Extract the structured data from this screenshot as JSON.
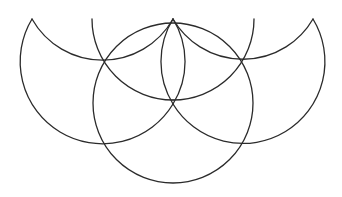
{
  "diagram": {
    "title": "",
    "background": "#ffffff",
    "stroke_color": "#2b2b2b",
    "stroke_width": 1.3,
    "shapes": [
      {
        "name": "center-circle",
        "type": "circle",
        "cx": 173,
        "cy": 103,
        "r": 80
      },
      {
        "name": "left-crescent-lower-arc",
        "type": "arc",
        "d": "M 32 19 A 81 81 0 1 0 173 104"
      },
      {
        "name": "left-crescent-upper-arc",
        "type": "arc",
        "d": "M 32 19 A 81 81 0 0 0 173 19"
      },
      {
        "name": "right-crescent-lower-arc",
        "type": "arc",
        "d": "M 313 19 A 81 81 0 1 1 173 104"
      },
      {
        "name": "right-crescent-upper-arc",
        "type": "arc",
        "d": "M 313 19 A 81 81 0 0 1 173 19"
      },
      {
        "name": "left-vertical-arc",
        "type": "arc",
        "d": "M 92 19 A 81 81 0 0 0 173 100"
      },
      {
        "name": "right-vertical-arc",
        "type": "arc",
        "d": "M 254 19 A 81 81 0 0 1 173 100"
      },
      {
        "name": "inner-left-lens-arc",
        "type": "arc",
        "d": "M 173 19 A 81 81 0 0 0 173 104"
      },
      {
        "name": "inner-right-lens-arc",
        "type": "arc",
        "d": "M 173 19 A 81 81 0 0 1 173 104"
      }
    ]
  }
}
